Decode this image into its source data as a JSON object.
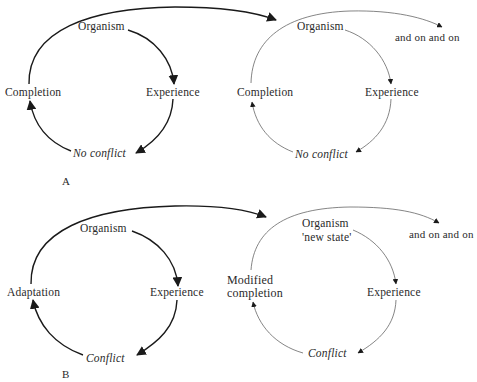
{
  "diagram": {
    "panel_a": {
      "letter": "A",
      "cycle_1": {
        "organism": "Organism",
        "experience": "Experience",
        "outcome": "No conflict",
        "completion": "Completion"
      },
      "cycle_2": {
        "organism": "Organism",
        "experience": "Experience",
        "outcome": "No conflict",
        "completion": "Completion",
        "continuation": "and on and on"
      }
    },
    "panel_b": {
      "letter": "B",
      "cycle_1": {
        "organism": "Organism",
        "experience": "Experience",
        "outcome": "Conflict",
        "completion": "Adaptation"
      },
      "cycle_2": {
        "organism": "Organism",
        "organism_state": "'new state'",
        "experience": "Experience",
        "outcome": "Conflict",
        "completion_line1": "Modified",
        "completion_line2": "completion",
        "continuation": "and on and on"
      }
    },
    "colors": {
      "bold_stroke": "#1a1a1a",
      "thin_stroke": "#555555",
      "text": "#2a2a2a"
    }
  }
}
